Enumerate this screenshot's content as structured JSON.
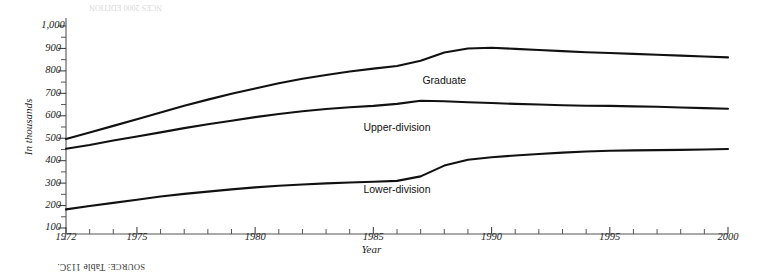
{
  "figure": {
    "rotation_degrees": 180,
    "background_color": "#ffffff",
    "line_color": "#111111",
    "axis_color": "#555555"
  },
  "source": {
    "label": "SOURCE:",
    "value": "Table 113C."
  },
  "footer": {
    "faint_text": "NCES 2000 EDITION"
  },
  "chart_data": {
    "type": "line",
    "title": "",
    "subtitle": "",
    "xlabel": "Year",
    "ylabel": "In thousands",
    "grid": false,
    "legend_position": "inline-labels",
    "xlim": [
      1972,
      2000
    ],
    "ylim": [
      0,
      1000
    ],
    "x_tick_labels": [
      "1972",
      "1975",
      "1980",
      "1985",
      "1990",
      "1995",
      "2000"
    ],
    "x_tick_values": [
      1972,
      1975,
      1980,
      1985,
      1990,
      1995,
      2000
    ],
    "x_minor_tick_values": [
      1973,
      1974,
      1976,
      1977,
      1978,
      1979,
      1981,
      1982,
      1983,
      1984,
      1986,
      1987,
      1988,
      1989,
      1991,
      1992,
      1993,
      1994,
      1996,
      1997,
      1998,
      1999
    ],
    "y_tick_labels": [
      "100",
      "200",
      "300",
      "400",
      "500",
      "600",
      "700",
      "800",
      "900",
      "1,000"
    ],
    "y_tick_values": [
      100,
      200,
      300,
      400,
      500,
      600,
      700,
      800,
      900,
      1000
    ],
    "x": [
      1972,
      1973,
      1974,
      1975,
      1976,
      1977,
      1978,
      1979,
      1980,
      1981,
      1982,
      1983,
      1984,
      1985,
      1986,
      1987,
      1988,
      1989,
      1990,
      1991,
      1992,
      1993,
      1994,
      1995,
      1996,
      1997,
      1998,
      1999,
      2000
    ],
    "series": [
      {
        "name": "Lower-division",
        "label": "Lower-division",
        "color": "#111111",
        "values": [
          183,
          198,
          212,
          226,
          240,
          252,
          262,
          272,
          281,
          288,
          294,
          299,
          303,
          306,
          310,
          330,
          378,
          404,
          415,
          423,
          430,
          436,
          441,
          444,
          446,
          447,
          448,
          450,
          452
        ]
      },
      {
        "name": "Upper-division",
        "label": "Upper-division",
        "color": "#111111",
        "values": [
          453,
          470,
          490,
          508,
          526,
          545,
          562,
          578,
          594,
          608,
          620,
          630,
          638,
          644,
          653,
          667,
          665,
          660,
          657,
          653,
          650,
          647,
          645,
          644,
          642,
          640,
          637,
          634,
          631
        ]
      },
      {
        "name": "Graduate",
        "label": "Graduate",
        "color": "#111111",
        "values": [
          497,
          525,
          555,
          585,
          615,
          645,
          672,
          698,
          722,
          745,
          765,
          782,
          797,
          810,
          822,
          845,
          882,
          900,
          903,
          898,
          893,
          888,
          883,
          880,
          876,
          872,
          868,
          864,
          860
        ]
      }
    ],
    "series_label_positions": [
      {
        "name": "Lower-division",
        "x_year": 1986,
        "y_value": 258
      },
      {
        "name": "Upper-division",
        "x_year": 1986,
        "y_value": 530
      },
      {
        "name": "Graduate",
        "x_year": 1988,
        "y_value": 740
      }
    ]
  }
}
